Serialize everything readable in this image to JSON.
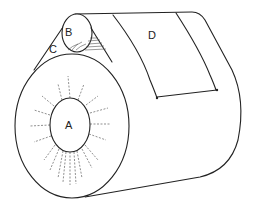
{
  "diagram": {
    "type": "roll-and-web schematic",
    "labels": {
      "a": "A",
      "b": "B",
      "c": "C",
      "d": "D"
    },
    "parts": [
      {
        "id": "A",
        "description": "large wound roll core (front face)"
      },
      {
        "id": "B",
        "description": "small roll / nip roller on top"
      },
      {
        "id": "C",
        "description": "wedge gap between rolls"
      },
      {
        "id": "D",
        "description": "web/sheet panel wrapping over rolls"
      }
    ],
    "colors": {
      "stroke": "#222222",
      "background": "#ffffff"
    }
  }
}
